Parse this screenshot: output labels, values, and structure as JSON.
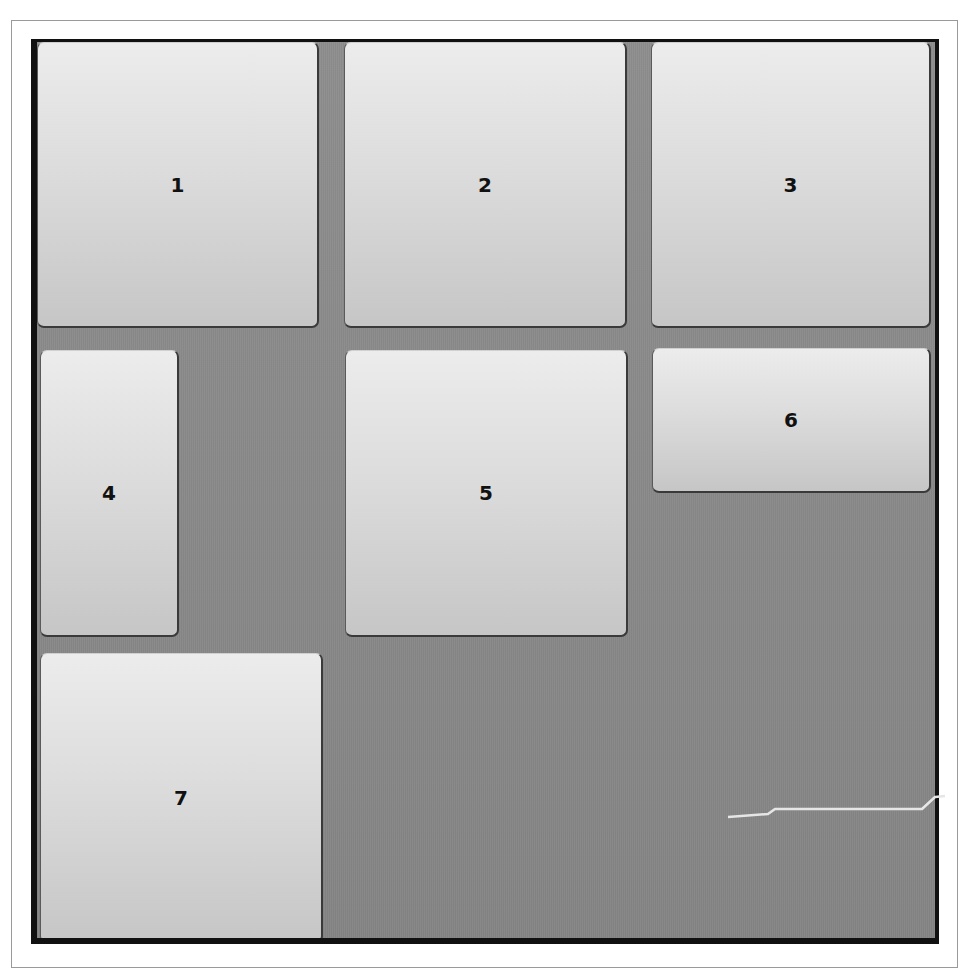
{
  "puzzle": {
    "tiles": [
      {
        "label": "1",
        "x": 6,
        "y": 3,
        "w": 282,
        "h": 286
      },
      {
        "label": "2",
        "x": 313,
        "y": 3,
        "w": 283,
        "h": 286
      },
      {
        "label": "3",
        "x": 620,
        "y": 3,
        "w": 279,
        "h": 286
      },
      {
        "label": "4",
        "x": 9,
        "y": 309,
        "w": 139,
        "h": 286
      },
      {
        "label": "5",
        "x": 314,
        "y": 309,
        "w": 283,
        "h": 286
      },
      {
        "label": "6",
        "x": 621,
        "y": 307,
        "w": 278,
        "h": 143
      },
      {
        "label": "7",
        "x": 9,
        "y": 612,
        "w": 282,
        "h": 284
      }
    ],
    "colors": {
      "board_background": "#8c8c8c",
      "frame": "#111111",
      "tile_top": "#ececec",
      "tile_bottom": "#c6c6c6",
      "label": "#111111"
    }
  }
}
